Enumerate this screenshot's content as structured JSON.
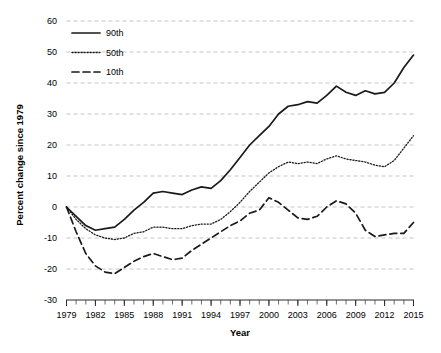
{
  "chart_data": {
    "type": "line",
    "title": "",
    "xlabel": "Year",
    "ylabel": "Percent change since 1979",
    "xlim": [
      1979,
      2015
    ],
    "ylim": [
      -30,
      60
    ],
    "ytick_labels": [
      "60",
      "50",
      "40",
      "30",
      "20",
      "10",
      "0",
      "-10",
      "-20",
      "-30"
    ],
    "yticks": [
      60,
      50,
      40,
      30,
      20,
      10,
      0,
      -10,
      -20,
      -30
    ],
    "xtick_labels": [
      "1979",
      "1982",
      "1985",
      "1988",
      "1991",
      "1994",
      "1997",
      "2000",
      "2003",
      "2006",
      "2009",
      "2012",
      "2015"
    ],
    "xticks": [
      1979,
      1982,
      1985,
      1988,
      1991,
      1994,
      1997,
      2000,
      2003,
      2006,
      2009,
      2012,
      2015
    ],
    "minor_xticks_every": 1,
    "grid": "horizontal-dashed",
    "legend_position": "upper-left-inside",
    "x": [
      1979,
      1980,
      1981,
      1982,
      1983,
      1984,
      1985,
      1986,
      1987,
      1988,
      1989,
      1990,
      1991,
      1992,
      1993,
      1994,
      1995,
      1996,
      1997,
      1998,
      1999,
      2000,
      2001,
      2002,
      2003,
      2004,
      2005,
      2006,
      2007,
      2008,
      2009,
      2010,
      2011,
      2012,
      2013,
      2014,
      2015
    ],
    "series": [
      {
        "name": "90th",
        "style": "solid",
        "color": "#1a1a1a",
        "values": [
          0,
          -3,
          -6,
          -7.5,
          -7,
          -6.5,
          -4,
          -1,
          1.5,
          4.5,
          5,
          4.5,
          4,
          5.5,
          6.5,
          6,
          8.5,
          12,
          16,
          20,
          23,
          26,
          30,
          32.5,
          33,
          34,
          33.5,
          36,
          39,
          37,
          36,
          37.5,
          36.5,
          37,
          40,
          45,
          49
        ]
      },
      {
        "name": "50th",
        "style": "dotted",
        "color": "#1a1a1a",
        "values": [
          0,
          -4,
          -7,
          -9,
          -10,
          -10.5,
          -10,
          -8.5,
          -8,
          -6.5,
          -6.5,
          -7,
          -7,
          -6,
          -5.5,
          -5.5,
          -4,
          -1.5,
          1.5,
          5,
          8,
          11,
          13,
          14.5,
          14,
          14.5,
          14,
          15.5,
          16.5,
          15.5,
          15,
          14.5,
          13.5,
          13,
          15,
          19,
          23
        ]
      },
      {
        "name": "10th",
        "style": "dashed",
        "color": "#1a1a1a",
        "values": [
          0,
          -8,
          -15,
          -19,
          -21,
          -21.5,
          -19.5,
          -17.5,
          -16,
          -15,
          -16,
          -17,
          -16.5,
          -14,
          -12,
          -10,
          -8,
          -6,
          -4.5,
          -2,
          -1,
          3,
          1.5,
          -1,
          -3.5,
          -4,
          -3,
          0,
          2,
          1,
          -2,
          -7.5,
          -9.5,
          -9,
          -8.5,
          -8.5,
          -5
        ]
      }
    ]
  },
  "legend": {
    "entries": [
      {
        "label": "90th",
        "style": "solid"
      },
      {
        "label": "50th",
        "style": "dotted"
      },
      {
        "label": "10th",
        "style": "dashed"
      }
    ]
  }
}
